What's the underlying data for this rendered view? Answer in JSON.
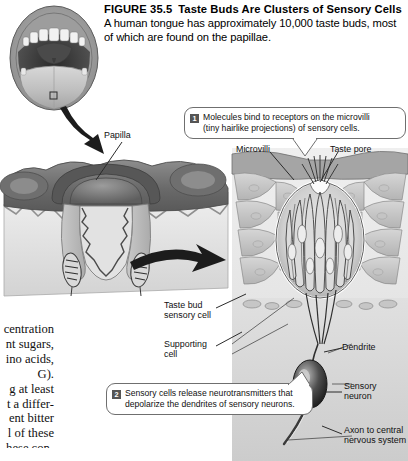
{
  "figure": {
    "number": "FIGURE 35.5",
    "title": "Taste Buds Are Clusters of Sensory Cells",
    "caption": "A human tongue has approximately 10,000 taste buds, most of which are found on the papillae."
  },
  "callouts": [
    {
      "badge": "1",
      "line1": "Molecules bind to receptors on the microvilli",
      "line2": "(tiny hairlike projections) of sensory cells."
    },
    {
      "badge": "2",
      "line1": "Sensory cells release neurotransmitters that",
      "line2": "depolarize the dendrites of sensory neurons."
    }
  ],
  "labels": {
    "papilla": "Papilla",
    "microvilli": "Microvilli",
    "taste_pore": "Taste pore",
    "taste_bud_sensory_cell_l1": "Taste bud",
    "taste_bud_sensory_cell_l2": "sensory cell",
    "supporting_cell_l1": "Supporting",
    "supporting_cell_l2": "cell",
    "dendrite": "Dendrite",
    "sensory_neuron_l1": "Sensory",
    "sensory_neuron_l2": "neuron",
    "axon_l1": "Axon to central",
    "axon_l2": "nervous system"
  },
  "margin_text": {
    "lines": [
      "centration",
      "nt sugars,",
      "ino acids,",
      "G).",
      "g at least",
      "t a differ-",
      "ent bitter",
      "l of these",
      "hese con-"
    ]
  },
  "colors": {
    "ink": "#111111",
    "callout_border": "#6f6f6f",
    "badge_bg": "#555555",
    "panel_bg": "#e4e4e4",
    "tissue_dark": "#6b6b6b",
    "tissue_mid": "#9a9a9a",
    "tissue_light": "#cfcfcf"
  }
}
